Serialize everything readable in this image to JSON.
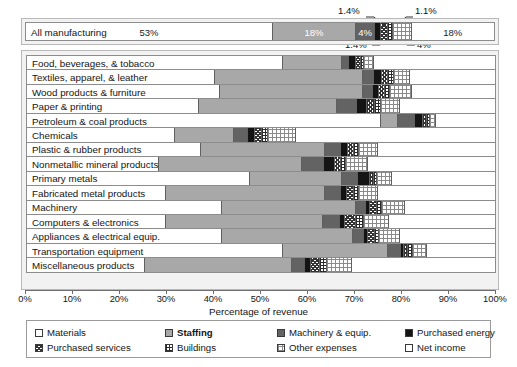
{
  "chart_data": {
    "type": "bar",
    "orientation": "horizontal",
    "stacked": true,
    "title": "",
    "xlabel": "Percentage of revenue",
    "ylabel": "",
    "xlim": [
      0,
      100
    ],
    "xticks": [
      "0%",
      "10%",
      "20%",
      "30%",
      "40%",
      "50%",
      "60%",
      "70%",
      "80%",
      "90%",
      "100%"
    ],
    "grid": false,
    "legend_position": "bottom",
    "series": [
      {
        "name": "Materials",
        "key": "materials",
        "swatch": "sw-materials",
        "bold": false
      },
      {
        "name": "Staffing",
        "key": "staffing",
        "swatch": "sw-staffing",
        "bold": true
      },
      {
        "name": "Machinery & equip.",
        "key": "machinery",
        "swatch": "sw-machinery",
        "bold": false
      },
      {
        "name": "Purchased energy",
        "key": "energy",
        "swatch": "sw-energy",
        "bold": false
      },
      {
        "name": "Purchased services",
        "key": "services",
        "swatch": "sw-services",
        "bold": false
      },
      {
        "name": "Buildings",
        "key": "buildings",
        "swatch": "sw-buildings",
        "bold": false
      },
      {
        "name": "Other expenses",
        "key": "other",
        "swatch": "sw-other",
        "bold": false
      },
      {
        "name": "Net income",
        "key": "netincome",
        "swatch": "sw-netincome",
        "bold": false
      }
    ],
    "summary_row": {
      "label": "All manufacturing",
      "values": [
        53,
        18,
        4,
        1.4,
        1.4,
        1.1,
        4,
        18
      ],
      "inline_labels": [
        {
          "index": 0,
          "text": "53%",
          "tone": "dark"
        },
        {
          "index": 1,
          "text": "18%",
          "tone": "light"
        },
        {
          "index": 2,
          "text": "4%",
          "tone": "light"
        },
        {
          "index": 7,
          "text": "18%",
          "tone": "dark"
        }
      ],
      "callouts": [
        {
          "text": "1.4%",
          "x": 364,
          "y": 6,
          "anchor": "above-left"
        },
        {
          "text": "1.1%",
          "x": 412,
          "y": 6,
          "anchor": "above-right"
        },
        {
          "text": "1.4%",
          "x": 359,
          "y": 42,
          "anchor": "below-left"
        },
        {
          "text": "4%",
          "x": 411,
          "y": 42,
          "anchor": "below-right"
        }
      ]
    },
    "categories": [
      "Food, beverages, & tobacco",
      "Textiles, apparel, & leather",
      "Wood products & furniture",
      "Paper & printing",
      "Petroleum & coal products",
      "Chemicals",
      "Plastic & rubber products",
      "Nonmetallic mineral products",
      "Primary metals",
      "Fabricated metal products",
      "Machinery",
      "Computers & electronics",
      "Appliances & electrical equip.",
      "Transportation equipment",
      "Miscellaneous products"
    ],
    "rows": [
      {
        "category": "Food, beverages, & tobacco",
        "values": [
          54.5,
          12.5,
          1.6,
          1.4,
          1.1,
          0.8,
          2.1,
          26.0
        ]
      },
      {
        "category": "Textiles, apparel, & leather",
        "values": [
          40.0,
          31.5,
          2.5,
          1.6,
          1.4,
          1.2,
          3.5,
          18.3
        ]
      },
      {
        "category": "Wood products & furniture",
        "values": [
          41.0,
          30.5,
          2.2,
          1.3,
          1.3,
          1.1,
          4.6,
          18.0
        ]
      },
      {
        "category": "Paper & printing",
        "values": [
          36.5,
          29.5,
          4.2,
          2.3,
          1.6,
          1.3,
          4.0,
          20.6
        ]
      },
      {
        "category": "Petroleum & coal products",
        "values": [
          75.5,
          3.5,
          3.6,
          1.9,
          0.7,
          0.6,
          1.4,
          12.8
        ]
      },
      {
        "category": "Chemicals",
        "values": [
          31.5,
          12.5,
          3.0,
          1.6,
          1.3,
          1.4,
          6.0,
          42.7
        ]
      },
      {
        "category": "Plastic & rubber products",
        "values": [
          37.0,
          26.5,
          3.3,
          1.5,
          1.3,
          1.1,
          4.1,
          25.2
        ]
      },
      {
        "category": "Nonmetallic mineral products",
        "values": [
          28.0,
          30.5,
          4.8,
          2.4,
          1.2,
          1.1,
          4.6,
          27.4
        ]
      },
      {
        "category": "Primary metals",
        "values": [
          47.5,
          19.5,
          3.5,
          2.6,
          0.8,
          0.6,
          3.3,
          22.2
        ]
      },
      {
        "category": "Fabricated metal products",
        "values": [
          29.5,
          34.0,
          3.4,
          1.2,
          1.5,
          1.2,
          4.1,
          25.1
        ]
      },
      {
        "category": "Machinery",
        "values": [
          41.5,
          28.5,
          2.2,
          0.9,
          1.4,
          1.1,
          4.9,
          19.5
        ]
      },
      {
        "category": "Computers & electronics",
        "values": [
          29.5,
          33.5,
          3.6,
          1.1,
          2.3,
          1.7,
          5.5,
          22.8
        ]
      },
      {
        "category": "Appliances & electrical equip.",
        "values": [
          41.5,
          28.0,
          2.4,
          0.8,
          1.4,
          1.0,
          4.4,
          20.5
        ]
      },
      {
        "category": "Transportation equipment",
        "values": [
          54.5,
          22.5,
          2.6,
          0.7,
          1.0,
          0.9,
          3.1,
          14.7
        ]
      },
      {
        "category": "Miscellaneous products",
        "values": [
          25.0,
          31.5,
          2.6,
          1.3,
          2.1,
          1.3,
          5.4,
          30.8
        ]
      }
    ]
  }
}
